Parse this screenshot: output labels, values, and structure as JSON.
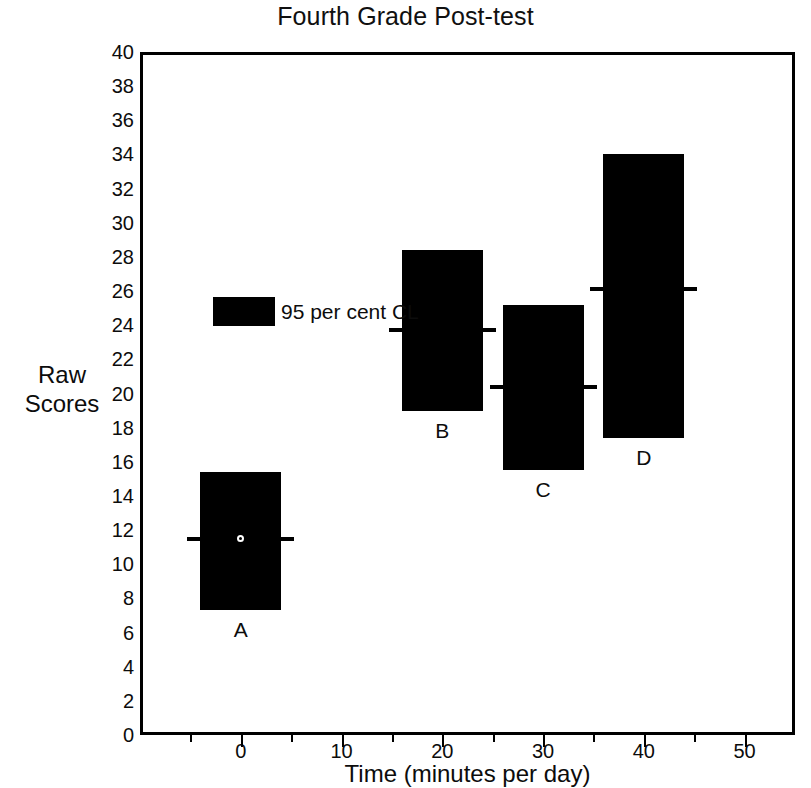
{
  "chart_data": {
    "type": "bar",
    "title": "Fourth Grade Post-test",
    "xlabel": "Time (minutes per day)",
    "ylabel": "Raw Scores",
    "xlim": [
      -10,
      55
    ],
    "ylim": [
      0,
      40
    ],
    "grid": false,
    "legend_position": "inside-upper-left",
    "legend": [
      {
        "label": "95 per cent CL",
        "swatch_color": "#000000"
      }
    ],
    "x_ticks": [
      0,
      10,
      20,
      30,
      40,
      50
    ],
    "x_tick_labels": [
      "0",
      "10",
      "20",
      "30",
      "40",
      "50"
    ],
    "y_ticks": [
      0,
      2,
      4,
      6,
      8,
      10,
      12,
      14,
      16,
      18,
      20,
      22,
      24,
      26,
      28,
      30,
      32,
      34,
      36,
      38,
      40
    ],
    "y_tick_labels": [
      "0",
      "2",
      "4",
      "6",
      "8",
      "10",
      "12",
      "14",
      "16",
      "18",
      "20",
      "22",
      "24",
      "26",
      "28",
      "30",
      "32",
      "34",
      "36",
      "38",
      "40"
    ],
    "categories": [
      "A",
      "B",
      "C",
      "D"
    ],
    "x": [
      0,
      20,
      30,
      40
    ],
    "series": [
      {
        "name": "mean",
        "values": [
          11.5,
          23.7,
          20.4,
          26.1
        ]
      },
      {
        "name": "ci_lower",
        "values": [
          7.3,
          19.0,
          15.5,
          17.4
        ]
      },
      {
        "name": "ci_upper",
        "values": [
          15.4,
          28.4,
          25.2,
          34.0
        ]
      }
    ],
    "points": [
      {
        "label": "A",
        "x": 0,
        "ci_lower": 7.3,
        "ci_upper": 15.4,
        "mean": 11.5,
        "has_marker": true
      },
      {
        "label": "B",
        "x": 20,
        "ci_lower": 19.0,
        "ci_upper": 28.4,
        "mean": 23.7,
        "has_marker": false
      },
      {
        "label": "C",
        "x": 30,
        "ci_lower": 15.5,
        "ci_upper": 25.2,
        "mean": 20.4,
        "has_marker": false
      },
      {
        "label": "D",
        "x": 40,
        "ci_lower": 17.4,
        "ci_upper": 34.0,
        "mean": 26.1,
        "has_marker": false
      }
    ]
  }
}
